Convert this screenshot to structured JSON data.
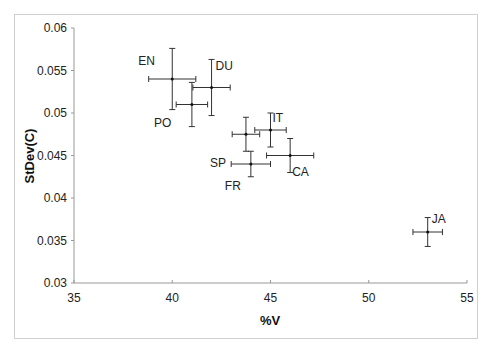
{
  "chart_data": {
    "type": "scatter",
    "title": "",
    "xlabel": "%V",
    "ylabel": "StDev(C)",
    "xlim": [
      35,
      55
    ],
    "ylim": [
      0.03,
      0.06
    ],
    "xticks": [
      "35",
      "40",
      "45",
      "50",
      "55"
    ],
    "yticks": [
      "0.03",
      "0.035",
      "0.04",
      "0.045",
      "0.05",
      "0.055",
      "0.06"
    ],
    "grid": false,
    "legend": null,
    "error_bars": true,
    "points": [
      {
        "label": "EN",
        "x": 40.0,
        "y": 0.054,
        "xerr": 1.2,
        "yerr": 0.0036
      },
      {
        "label": "PO",
        "x": 41.0,
        "y": 0.051,
        "xerr": 0.8,
        "yerr": 0.0026
      },
      {
        "label": "DU",
        "x": 42.0,
        "y": 0.053,
        "xerr": 0.95,
        "yerr": 0.0033
      },
      {
        "label": "SP",
        "x": 43.75,
        "y": 0.0475,
        "xerr": 0.7,
        "yerr": 0.002
      },
      {
        "label": "IT",
        "x": 45.0,
        "y": 0.048,
        "xerr": 0.8,
        "yerr": 0.002
      },
      {
        "label": "FR",
        "x": 44.0,
        "y": 0.044,
        "xerr": 1.0,
        "yerr": 0.0015
      },
      {
        "label": "CA",
        "x": 46.0,
        "y": 0.045,
        "xerr": 1.2,
        "yerr": 0.002
      },
      {
        "label": "JA",
        "x": 53.0,
        "y": 0.036,
        "xerr": 0.75,
        "yerr": 0.0017
      }
    ]
  }
}
